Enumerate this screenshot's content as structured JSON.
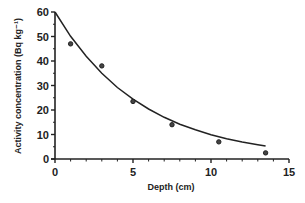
{
  "chart_data": {
    "type": "scatter",
    "title": "",
    "xlabel": "Depth (cm)",
    "ylabel": "Activity concentration (Bq kg⁻¹)",
    "xlim": [
      0,
      15
    ],
    "ylim": [
      0,
      60
    ],
    "x_ticks": [
      0,
      5,
      10,
      15
    ],
    "y_ticks": [
      0,
      10,
      20,
      30,
      40,
      50,
      60
    ],
    "grid": false,
    "legend": null,
    "series": [
      {
        "name": "Measured",
        "type": "scatter",
        "marker": "circle",
        "x": [
          1.0,
          3.0,
          5.0,
          7.5,
          10.5,
          13.5
        ],
        "y": [
          47,
          38,
          23.5,
          14,
          7,
          2.5
        ]
      },
      {
        "name": "Exponential fit",
        "type": "line",
        "equation": "y = 60 * exp(-0.18 x)",
        "x": [
          0,
          1,
          2,
          3,
          4,
          5,
          6,
          7,
          8,
          9,
          10,
          11,
          12,
          13,
          13.5
        ],
        "y": [
          60,
          50.1,
          41.9,
          35.0,
          29.2,
          24.4,
          20.4,
          17.0,
          14.2,
          11.9,
          9.9,
          8.3,
          6.9,
          5.8,
          5.3
        ]
      }
    ]
  }
}
